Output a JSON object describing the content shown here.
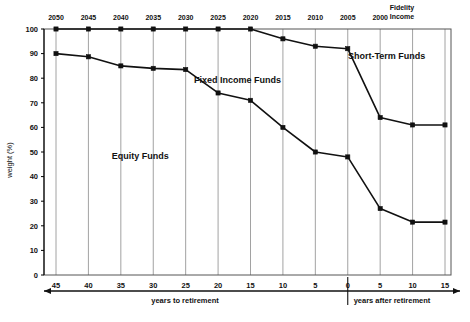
{
  "chart_data": {
    "type": "line",
    "title": "",
    "xlabel": "years to retirement / years after retirement",
    "ylabel": "weight (%)",
    "ylim": [
      0,
      100
    ],
    "yticks": [
      0,
      10,
      20,
      30,
      40,
      50,
      60,
      70,
      80,
      90,
      100
    ],
    "grid": true,
    "legend_position": "inline-annotations",
    "x": [
      45,
      40,
      35,
      30,
      25,
      20,
      15,
      10,
      5,
      0,
      -5,
      -10,
      -15
    ],
    "x_tick_labels": [
      "45",
      "40",
      "35",
      "30",
      "25",
      "20",
      "15",
      "10",
      "5",
      "0",
      "5",
      "10",
      "15"
    ],
    "top_tick_labels": [
      "2050",
      "2045",
      "2040",
      "2035",
      "2030",
      "2025",
      "2020",
      "2015",
      "2010",
      "2005",
      "2000",
      "Fidelity Income",
      ""
    ],
    "series": [
      {
        "name": "Equity Funds (upper boundary of equity region)",
        "values": [
          90,
          88.7,
          85,
          84,
          83.5,
          74,
          71,
          60,
          50,
          48,
          27,
          21.5,
          21.5
        ]
      },
      {
        "name": "Equity + Fixed Income Funds (upper boundary)",
        "values": [
          100,
          100,
          100,
          100,
          100,
          100,
          100,
          96,
          93,
          92,
          64,
          61,
          61
        ]
      }
    ],
    "annotations": [
      {
        "text": "Equity Funds",
        "x": 32,
        "y": 47
      },
      {
        "text": "Fixed Income Funds",
        "x": 17,
        "y": 78
      },
      {
        "text": "Short-Term Funds",
        "x": -6,
        "y": 88
      }
    ],
    "axis_notes": {
      "left_axis_label": "years to retirement",
      "right_axis_label": "years after retirement",
      "divider_at": 0
    }
  },
  "axis": {
    "y_title": "weight (%)",
    "y_ticks": [
      "100",
      "90",
      "80",
      "70",
      "60",
      "50",
      "40",
      "30",
      "20",
      "10",
      "0"
    ],
    "x_ticks": [
      "45",
      "40",
      "35",
      "30",
      "25",
      "20",
      "15",
      "10",
      "5",
      "0",
      "5",
      "10",
      "15"
    ],
    "top_ticks": [
      "2050",
      "2045",
      "2040",
      "2035",
      "2030",
      "2025",
      "2020",
      "2015",
      "2010",
      "2005",
      "2000"
    ],
    "fidelity_label_line1": "Fidelity",
    "fidelity_label_line2": "Income",
    "left_axis_title": "years to retirement",
    "right_axis_title": "years after retirement"
  },
  "annotations": {
    "equity": "Equity Funds",
    "fixed_income": "Fixed Income Funds",
    "short_term": "Short-Term Funds"
  }
}
